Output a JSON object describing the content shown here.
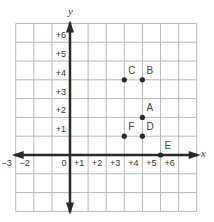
{
  "diagram": {
    "type": "coordinate-grid",
    "axes": {
      "x_label": "x",
      "y_label": "y",
      "x_range": [
        -3,
        7
      ],
      "y_range": [
        -3,
        7
      ]
    },
    "x_tick_labels": [
      {
        "value": -3,
        "text": "−3"
      },
      {
        "value": -2,
        "text": "−2"
      },
      {
        "value": 0,
        "text": "0"
      },
      {
        "value": 1,
        "text": "+1"
      },
      {
        "value": 2,
        "text": "+2"
      },
      {
        "value": 3,
        "text": "+3"
      },
      {
        "value": 4,
        "text": "+4"
      },
      {
        "value": 5,
        "text": "+5"
      },
      {
        "value": 6,
        "text": "+6"
      }
    ],
    "y_tick_labels": [
      {
        "value": 1,
        "text": "+1"
      },
      {
        "value": 2,
        "text": "+2"
      },
      {
        "value": 3,
        "text": "+3"
      },
      {
        "value": 4,
        "text": "+4"
      },
      {
        "value": 5,
        "text": "+5"
      },
      {
        "value": 6,
        "text": "+6"
      }
    ],
    "points": [
      {
        "label": "A",
        "x": 4,
        "y": 2
      },
      {
        "label": "B",
        "x": 4,
        "y": 4
      },
      {
        "label": "C",
        "x": 3,
        "y": 4
      },
      {
        "label": "D",
        "x": 4,
        "y": 1
      },
      {
        "label": "E",
        "x": 5,
        "y": 0
      },
      {
        "label": "F",
        "x": 3,
        "y": 1
      }
    ],
    "colors": {
      "grid": "#b8b8b8",
      "axis": "#2a2a2a",
      "point": "#2a2a2a",
      "text": "#333333"
    }
  }
}
